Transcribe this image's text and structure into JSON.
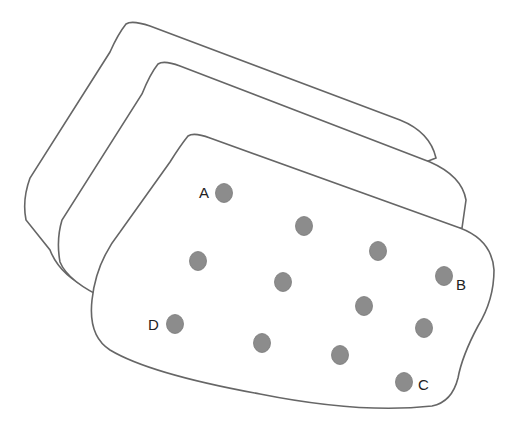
{
  "diagram": {
    "layers": [
      {
        "id": "back",
        "fill": "#ffffff",
        "stroke": "#666666"
      },
      {
        "id": "middle",
        "fill": "#ffffff",
        "stroke": "#666666"
      },
      {
        "id": "front",
        "fill": "#ffffff",
        "stroke": "#666666"
      }
    ],
    "point_color": "#8c8c8c",
    "points": [
      {
        "x": 224,
        "y": 193,
        "label": "A"
      },
      {
        "x": 304,
        "y": 226,
        "label": ""
      },
      {
        "x": 378,
        "y": 251,
        "label": ""
      },
      {
        "x": 198,
        "y": 261,
        "label": ""
      },
      {
        "x": 283,
        "y": 282,
        "label": ""
      },
      {
        "x": 444,
        "y": 276,
        "label": "B"
      },
      {
        "x": 364,
        "y": 306,
        "label": ""
      },
      {
        "x": 175,
        "y": 324,
        "label": "D"
      },
      {
        "x": 424,
        "y": 328,
        "label": ""
      },
      {
        "x": 262,
        "y": 343,
        "label": ""
      },
      {
        "x": 340,
        "y": 355,
        "label": ""
      },
      {
        "x": 404,
        "y": 382,
        "label": "C"
      }
    ],
    "labels": {
      "A": "A",
      "B": "B",
      "C": "C",
      "D": "D"
    }
  }
}
